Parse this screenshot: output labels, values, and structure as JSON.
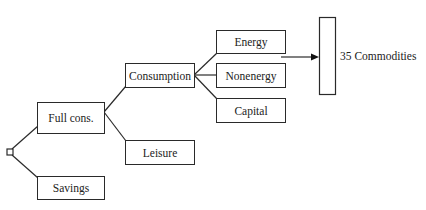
{
  "diagram": {
    "type": "nested tree",
    "root": {
      "name": "root-node",
      "shape": "small-square"
    },
    "nodes": {
      "full_cons": "Full cons.",
      "savings": "Savings",
      "consumption": "Consumption",
      "leisure": "Leisure",
      "energy": "Energy",
      "nonenergy": "Nonenergy",
      "capital": "Capital",
      "commodities": "35 Commodities"
    },
    "edges": [
      [
        "root",
        "full_cons"
      ],
      [
        "root",
        "savings"
      ],
      [
        "full_cons",
        "consumption"
      ],
      [
        "full_cons",
        "leisure"
      ],
      [
        "consumption",
        "energy"
      ],
      [
        "consumption",
        "nonenergy"
      ],
      [
        "consumption",
        "capital"
      ],
      [
        "nonenergy",
        "commodities"
      ]
    ],
    "colors": {
      "line": "#2a2a2a",
      "background": "#ffffff",
      "text": "#222222"
    }
  }
}
